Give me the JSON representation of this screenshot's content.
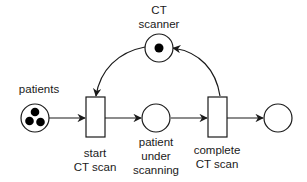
{
  "diagram": {
    "type": "petri-net",
    "places": [
      {
        "id": "patients",
        "label": "patients",
        "tokens": 3
      },
      {
        "id": "ct-scanner",
        "label_lines": [
          "CT",
          "scanner"
        ],
        "tokens": 1
      },
      {
        "id": "patient-under-scanning",
        "label_lines": [
          "patient",
          "under",
          "scanning"
        ],
        "tokens": 0
      },
      {
        "id": "end",
        "label": "",
        "tokens": 0
      }
    ],
    "transitions": [
      {
        "id": "start-ct-scan",
        "label_lines": [
          "start",
          "CT scan"
        ]
      },
      {
        "id": "complete-ct-scan",
        "label_lines": [
          "complete",
          "CT scan"
        ]
      }
    ],
    "arcs": [
      {
        "from": "patients",
        "to": "start-ct-scan"
      },
      {
        "from": "ct-scanner",
        "to": "start-ct-scan"
      },
      {
        "from": "start-ct-scan",
        "to": "patient-under-scanning"
      },
      {
        "from": "patient-under-scanning",
        "to": "complete-ct-scan"
      },
      {
        "from": "complete-ct-scan",
        "to": "ct-scanner"
      },
      {
        "from": "complete-ct-scan",
        "to": "end"
      }
    ],
    "colors": {
      "stroke": "#1a1a1a",
      "token": "#000000",
      "background": "#ffffff"
    }
  },
  "labels": {
    "patients": "patients",
    "ct_scanner_1": "CT",
    "ct_scanner_2": "scanner",
    "start_1": "start",
    "start_2": "CT scan",
    "pus_1": "patient",
    "pus_2": "under",
    "pus_3": "scanning",
    "complete_1": "complete",
    "complete_2": "CT scan"
  }
}
